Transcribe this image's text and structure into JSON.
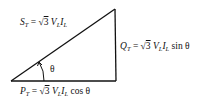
{
  "diagram": {
    "vertices": {
      "left": [
        11,
        81
      ],
      "corner": [
        116,
        81
      ],
      "apex": [
        115,
        9
      ]
    },
    "colors": {
      "line": "#111111",
      "background": "#ffffff"
    },
    "labels": {
      "hypotenuse": {
        "symbol": "S",
        "sub": "T",
        "eq": " = √",
        "root": "3",
        "v": " V",
        "vsub": "L",
        "i": "I",
        "isub": "L",
        "tail": ""
      },
      "vertical": {
        "symbol": "Q",
        "sub": "T",
        "eq": " = √",
        "root": "3",
        "v": " V",
        "vsub": "L",
        "i": "I",
        "isub": "L",
        "tail": " sin θ"
      },
      "base": {
        "symbol": "P",
        "sub": "T",
        "eq": " = √",
        "root": "3",
        "v": " V",
        "vsub": "L",
        "i": "I",
        "isub": "L",
        "tail": " cos θ"
      },
      "angle": "θ"
    }
  }
}
